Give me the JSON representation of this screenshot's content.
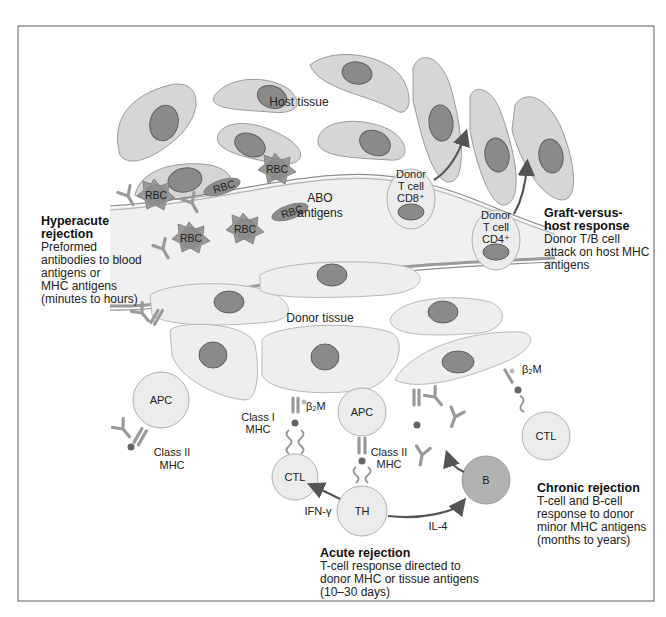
{
  "figure": {
    "colors": {
      "cell_fill": "#d6d6d6",
      "nucleus_fill": "#8a8a8a",
      "vessel_fill": "#f0f0f0",
      "b_cell_fill": "#b2b2b2",
      "arrow": "#555555",
      "frame": "#777777"
    },
    "labels": {
      "host_tissue": "Host tissue",
      "donor_tissue": "Donor tissue",
      "abo_line1": "ABO",
      "abo_line2": "antigens",
      "rbc": "RBC",
      "donor_cd8": {
        "l1": "Donor",
        "l2": "T cell",
        "l3": "CD8⁺"
      },
      "donor_cd4": {
        "l1": "Donor",
        "l2": "T cell",
        "l3": "CD4⁺"
      },
      "apc": "APC",
      "ctl": "CTL",
      "th": "TH",
      "b": "B",
      "b2m": "β₂M",
      "class1": {
        "l1": "Class I",
        "l2": "MHC"
      },
      "class2": {
        "l1": "Class II",
        "l2": "MHC"
      },
      "ifn": "IFN-γ",
      "il4": "IL-4"
    },
    "annotations": {
      "hyperacute": {
        "title1": "Hyperacute",
        "title2": "rejection",
        "lines": [
          "Preformed",
          "antibodies to blood",
          "antigens or",
          "MHC antigens",
          "(minutes to hours)"
        ]
      },
      "gvh": {
        "title1": "Graft-versus-",
        "title2": "host response",
        "lines": [
          "Donor T/B cell",
          "attack on host MHC",
          "antigens"
        ]
      },
      "chronic": {
        "title": "Chronic rejection",
        "lines": [
          "T-cell and B-cell",
          "response to donor",
          "minor MHC antigens",
          "(months to years)"
        ]
      },
      "acute": {
        "title": "Acute rejection",
        "lines": [
          "T-cell response directed to",
          "donor MHC or tissue antigens",
          "(10–30 days)"
        ]
      }
    }
  }
}
